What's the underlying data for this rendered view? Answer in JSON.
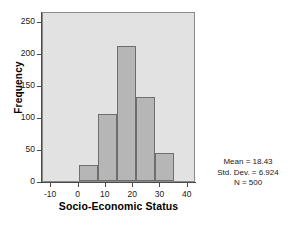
{
  "chart_data": {
    "type": "bar",
    "title": "",
    "subtitle": "",
    "xlabel": "Socio-Economic Status",
    "ylabel": "Frequency",
    "xlim": [
      -13,
      43
    ],
    "ylim": [
      0,
      265
    ],
    "xticks": [
      "-10",
      "0",
      "10",
      "20",
      "30",
      "40"
    ],
    "xtick_values": [
      -10,
      0,
      10,
      20,
      30,
      40
    ],
    "yticks": [
      "0",
      "50",
      "100",
      "150",
      "200",
      "250"
    ],
    "ytick_values": [
      0,
      50,
      100,
      150,
      200,
      250
    ],
    "grid": false,
    "legend": null,
    "bin_width": 7,
    "bin_edges": [
      0,
      7,
      14,
      21,
      28,
      35
    ],
    "categories": [
      "0-7",
      "7-14",
      "14-21",
      "21-28",
      "28-35"
    ],
    "values": [
      25,
      104,
      210,
      131,
      44
    ],
    "bar_color": "#b6b6b6",
    "bar_edge_color": "#6e6e6e",
    "plot_background": "#e2e2e2",
    "figure_background": "#ffffff",
    "axis_color": "#4a4a4a",
    "annotations": [
      "Mean = 18.43",
      "Std. Dev. = 6.924",
      "N = 500"
    ]
  },
  "stats": {
    "mean": "Mean = 18.43",
    "std_dev": "Std. Dev. = 6.924",
    "n": "N = 500"
  }
}
